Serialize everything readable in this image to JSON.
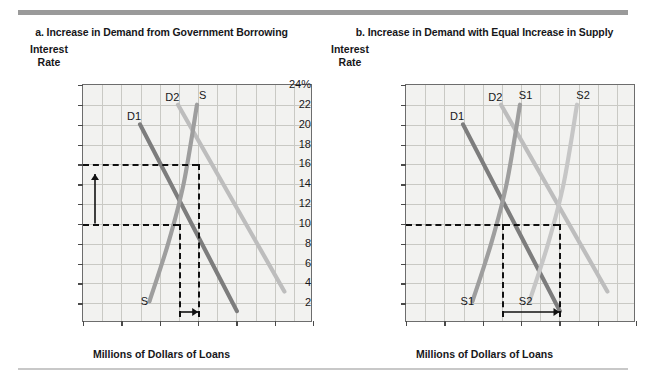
{
  "figure": {
    "axis_label_x": "Millions of Dollars of Loans",
    "axis_label_y_line1": "Interest",
    "axis_label_y_line2": "Rate"
  },
  "colors": {
    "d1": "#7d7d7d",
    "d2": "#bdbdbd",
    "s": "#9e9e9e",
    "s1": "#9e9e9e",
    "s2": "#c6c6c6",
    "dashed": "#111111",
    "plot_bg": "#f2f2f0",
    "grid": "#c9c9c4",
    "frame": "#6d6d6d"
  },
  "chart_data": [
    {
      "type": "line",
      "panel": "a",
      "title": "a. Increase in Demand from Government Borrowing",
      "xlabel": "Millions of Dollars of Loans",
      "ylabel": "Interest Rate",
      "xlim": [
        0,
        600
      ],
      "ylim": [
        0,
        24
      ],
      "xticks": [
        0,
        100,
        200,
        300,
        400,
        500,
        600
      ],
      "yticks": [
        2,
        4,
        6,
        8,
        10,
        12,
        14,
        16,
        18,
        20,
        22,
        24
      ],
      "ytick_labels": [
        "2",
        "4",
        "6",
        "8",
        "10",
        "12",
        "14",
        "16",
        "18",
        "20",
        "22",
        "24%"
      ],
      "grid": true,
      "legend": "inline-labels",
      "series": [
        {
          "name": "D1",
          "role": "demand-original",
          "color": "#7d7d7d",
          "points": [
            [
              150,
              20
            ],
            [
              405,
              1
            ]
          ],
          "label_x": 133,
          "label_y": 20.9
        },
        {
          "name": "D2",
          "role": "demand-shifted",
          "color": "#bdbdbd",
          "points": [
            [
              250,
              22
            ],
            [
              530,
              3
            ]
          ],
          "label_x": 233,
          "label_y": 22.8
        },
        {
          "name": "S",
          "role": "supply",
          "color": "#9e9e9e",
          "points": [
            [
              175,
              2
            ],
            [
              225,
              8
            ],
            [
              265,
              14
            ],
            [
              300,
              22
            ]
          ],
          "label_x": 312,
          "label_y": 23.0,
          "label_x2": 160,
          "label_y2": 2.2
        }
      ],
      "equilibria": [
        {
          "label": "initial",
          "quantity": 250,
          "rate": 10
        },
        {
          "label": "new",
          "quantity": 300,
          "rate": 16
        }
      ],
      "annotations": [
        {
          "type": "dashed-h",
          "rate": 16,
          "from_q": 0,
          "to_q": 300
        },
        {
          "type": "dashed-h",
          "rate": 10,
          "from_q": 0,
          "to_q": 250
        },
        {
          "type": "dashed-v",
          "quantity": 250,
          "from_rate": 0.6,
          "to_rate": 10
        },
        {
          "type": "dashed-v",
          "quantity": 300,
          "from_rate": 0.6,
          "to_rate": 16
        },
        {
          "type": "arrow-up",
          "quantity": 30,
          "from_rate": 10,
          "to_rate": 15
        },
        {
          "type": "arrow-right",
          "rate": 1.1,
          "from_q": 250,
          "to_q": 300
        }
      ]
    },
    {
      "type": "line",
      "panel": "b",
      "title": "b. Increase in Demand with Equal Increase in Supply",
      "xlabel": "Millions of Dollars of Loans",
      "ylabel": "Interest Rate",
      "xlim": [
        0,
        600
      ],
      "ylim": [
        0,
        24
      ],
      "xticks": [
        0,
        100,
        200,
        300,
        400,
        500,
        600
      ],
      "yticks": [
        2,
        4,
        6,
        8,
        10,
        12,
        14,
        16,
        18,
        20,
        22,
        24
      ],
      "ytick_labels": [
        "2",
        "4",
        "6",
        "8",
        "10",
        "12",
        "14",
        "16",
        "18",
        "20",
        "22",
        "24%"
      ],
      "grid": true,
      "legend": "inline-labels",
      "series": [
        {
          "name": "D1",
          "role": "demand-original",
          "color": "#7d7d7d",
          "points": [
            [
              150,
              20
            ],
            [
              405,
              1
            ]
          ],
          "label_x": 133,
          "label_y": 20.9
        },
        {
          "name": "D2",
          "role": "demand-shifted",
          "color": "#bdbdbd",
          "points": [
            [
              250,
              22
            ],
            [
              530,
              3
            ]
          ],
          "label_x": 233,
          "label_y": 22.8
        },
        {
          "name": "S1",
          "role": "supply-original",
          "color": "#9e9e9e",
          "points": [
            [
              175,
              2
            ],
            [
              225,
              8
            ],
            [
              265,
              14
            ],
            [
              300,
              22
            ]
          ],
          "label_x": 312,
          "label_y": 23.0,
          "label_x2": 160,
          "label_y2": 2.2
        },
        {
          "name": "S2",
          "role": "supply-shifted",
          "color": "#c6c6c6",
          "points": [
            [
              325,
              2
            ],
            [
              375,
              8
            ],
            [
              415,
              14
            ],
            [
              450,
              22
            ]
          ],
          "label_x": 462,
          "label_y": 23.0,
          "label_x2": 312,
          "label_y2": 2.2
        }
      ],
      "equilibria": [
        {
          "label": "initial",
          "quantity": 250,
          "rate": 10
        },
        {
          "label": "new",
          "quantity": 400,
          "rate": 10
        }
      ],
      "annotations": [
        {
          "type": "dashed-h",
          "rate": 10,
          "from_q": 0,
          "to_q": 400
        },
        {
          "type": "dashed-v",
          "quantity": 250,
          "from_rate": 0.6,
          "to_rate": 10
        },
        {
          "type": "dashed-v",
          "quantity": 400,
          "from_rate": 0.6,
          "to_rate": 10
        },
        {
          "type": "arrow-right",
          "rate": 1.1,
          "from_q": 250,
          "to_q": 400
        }
      ]
    }
  ]
}
